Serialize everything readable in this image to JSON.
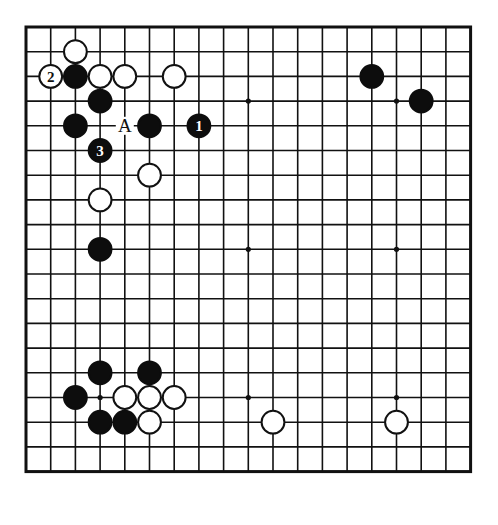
{
  "diagram": {
    "type": "go-board-diagram",
    "board_size": 19,
    "geometry": {
      "origin_x": 26,
      "origin_y": 27,
      "spacing": 24.7,
      "stone_radius": 11.4,
      "border_outer_width": 3.0,
      "line_width": 1.6
    },
    "colors": {
      "background": "#ffffff",
      "line": "#111111",
      "black_stone": "#0d0d0d",
      "white_stone_fill": "#ffffff",
      "white_stone_edge": "#111111",
      "label_on_black": "#ffffff",
      "label_on_white": "#111111",
      "board_label": "#111111"
    },
    "star_points": [
      {
        "col": 3,
        "row": 3
      },
      {
        "col": 9,
        "row": 3
      },
      {
        "col": 15,
        "row": 3
      },
      {
        "col": 3,
        "row": 9
      },
      {
        "col": 9,
        "row": 9
      },
      {
        "col": 15,
        "row": 9
      },
      {
        "col": 3,
        "row": 15
      },
      {
        "col": 9,
        "row": 15
      },
      {
        "col": 15,
        "row": 15
      }
    ],
    "stones": [
      {
        "id": "w-c2r1",
        "col": 2,
        "row": 1,
        "color": "white",
        "label": ""
      },
      {
        "id": "w-c1r2",
        "col": 1,
        "row": 2,
        "color": "white",
        "label": "2",
        "move_number": 2
      },
      {
        "id": "b-c2r2",
        "col": 2,
        "row": 2,
        "color": "black",
        "label": ""
      },
      {
        "id": "w-c3r2",
        "col": 3,
        "row": 2,
        "color": "white",
        "label": ""
      },
      {
        "id": "w-c4r2",
        "col": 4,
        "row": 2,
        "color": "white",
        "label": ""
      },
      {
        "id": "w-c6r2",
        "col": 6,
        "row": 2,
        "color": "white",
        "label": ""
      },
      {
        "id": "b-c14r2",
        "col": 14,
        "row": 2,
        "color": "black",
        "label": ""
      },
      {
        "id": "b-c3r3",
        "col": 3,
        "row": 3,
        "color": "black",
        "label": ""
      },
      {
        "id": "b-c16r3",
        "col": 16,
        "row": 3,
        "color": "black",
        "label": ""
      },
      {
        "id": "b-c2r4",
        "col": 2,
        "row": 4,
        "color": "black",
        "label": ""
      },
      {
        "id": "b-c5r4",
        "col": 5,
        "row": 4,
        "color": "black",
        "label": ""
      },
      {
        "id": "b-c7r4",
        "col": 7,
        "row": 4,
        "color": "black",
        "label": "1",
        "move_number": 1
      },
      {
        "id": "b-c3r5",
        "col": 3,
        "row": 5,
        "color": "black",
        "label": "3",
        "move_number": 3
      },
      {
        "id": "w-c5r6",
        "col": 5,
        "row": 6,
        "color": "white",
        "label": ""
      },
      {
        "id": "w-c3r7",
        "col": 3,
        "row": 7,
        "color": "white",
        "label": ""
      },
      {
        "id": "b-c3r9",
        "col": 3,
        "row": 9,
        "color": "black",
        "label": ""
      },
      {
        "id": "b-c3r14",
        "col": 3,
        "row": 14,
        "color": "black",
        "label": ""
      },
      {
        "id": "b-c5r14",
        "col": 5,
        "row": 14,
        "color": "black",
        "label": ""
      },
      {
        "id": "b-c2r15",
        "col": 2,
        "row": 15,
        "color": "black",
        "label": ""
      },
      {
        "id": "w-c4r15",
        "col": 4,
        "row": 15,
        "color": "white",
        "label": ""
      },
      {
        "id": "w-c5r15",
        "col": 5,
        "row": 15,
        "color": "white",
        "label": ""
      },
      {
        "id": "w-c6r15",
        "col": 6,
        "row": 15,
        "color": "white",
        "label": ""
      },
      {
        "id": "b-c3r16",
        "col": 3,
        "row": 16,
        "color": "black",
        "label": ""
      },
      {
        "id": "b-c4r16",
        "col": 4,
        "row": 16,
        "color": "black",
        "label": ""
      },
      {
        "id": "w-c5r16",
        "col": 5,
        "row": 16,
        "color": "white",
        "label": ""
      },
      {
        "id": "w-c10r16",
        "col": 10,
        "row": 16,
        "color": "white",
        "label": ""
      },
      {
        "id": "w-c15r16",
        "col": 15,
        "row": 16,
        "color": "white",
        "label": ""
      }
    ],
    "point_labels": [
      {
        "id": "label-A",
        "col": 4,
        "row": 4,
        "text": "A"
      }
    ],
    "caption": ""
  }
}
